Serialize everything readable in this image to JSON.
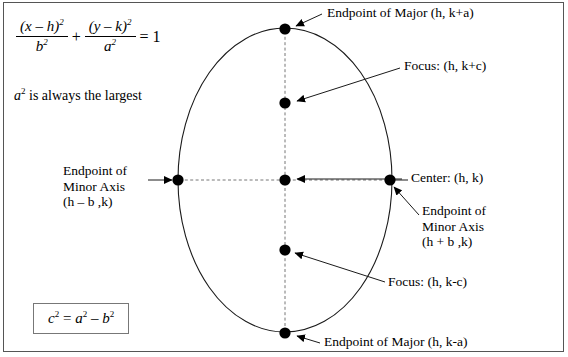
{
  "figure": {
    "type": "ellipse-diagram",
    "orientation": "vertical-major-axis",
    "background_color": "#ffffff",
    "line_color": "#000000",
    "frame_color": "#555555"
  },
  "equation": {
    "numerator_left": "(x – h)",
    "numerator_left_exp": "2",
    "denominator_left": "b",
    "denominator_left_exp": "2",
    "plus": "+",
    "numerator_right": "(y – k)",
    "numerator_right_exp": "2",
    "denominator_right": "a",
    "denominator_right_exp": "2",
    "equals": "= 1"
  },
  "note": {
    "symbol": "a",
    "symbol_exp": "2",
    "text": "is always the largest"
  },
  "boxed_formula": {
    "c": "c",
    "c_exp": "2",
    "eq": "=",
    "a": "a",
    "a_exp": "2",
    "minus": "–",
    "b": "b",
    "b_exp": "2",
    "plain": "c² = a² – b²"
  },
  "labels": {
    "endpoint_major_top": "Endpoint of Major (h, k+a)",
    "focus_top": "Focus: (h, k+c)",
    "center": "Center: (h, k)",
    "endpoint_minor_left_line1": "Endpoint of",
    "endpoint_minor_left_line2": "Minor Axis",
    "endpoint_minor_left_line3": "(h – b ,k)",
    "endpoint_minor_right_line1": "Endpoint of",
    "endpoint_minor_right_line2": "Minor Axis",
    "endpoint_minor_right_line3": "(h + b ,k)",
    "focus_bottom": "Focus: (h, k-c)",
    "endpoint_major_bottom": "Endpoint of Major (h, k-a)"
  },
  "points": [
    {
      "name": "endpoint-major-top",
      "x": 285,
      "y": 29,
      "coords": "(h, k+a)"
    },
    {
      "name": "focus-top",
      "x": 285,
      "y": 103,
      "coords": "(h, k+c)"
    },
    {
      "name": "center",
      "x": 285,
      "y": 180,
      "coords": "(h, k)"
    },
    {
      "name": "focus-bottom",
      "x": 285,
      "y": 250,
      "coords": "(h, k-c)"
    },
    {
      "name": "endpoint-major-bottom",
      "x": 285,
      "y": 333,
      "coords": "(h, k-a)"
    },
    {
      "name": "endpoint-minor-left",
      "x": 178,
      "y": 180,
      "coords": "(h – b ,k)"
    },
    {
      "name": "endpoint-minor-right",
      "x": 390,
      "y": 180,
      "coords": "(h + b ,k)"
    }
  ],
  "ellipse": {
    "cx": 285,
    "cy": 180,
    "rx": 107,
    "ry": 152
  }
}
